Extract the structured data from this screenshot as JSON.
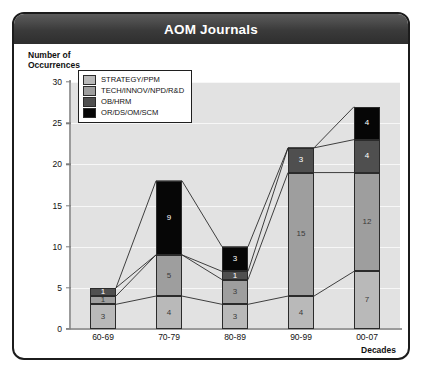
{
  "header": {
    "title": "AOM Journals"
  },
  "axis": {
    "y_title_line1": "Number of",
    "y_title_line2": "Occurrences",
    "x_title": "Decades"
  },
  "legend": {
    "items": [
      {
        "label": "STRATEGY/PPM",
        "color": "#b9b9b9"
      },
      {
        "label": "TECH/INNOV/NPD/R&D",
        "color": "#9e9e9e"
      },
      {
        "label": "OB/HRM",
        "color": "#4f4f4f"
      },
      {
        "label": "OR/DS/OM/SCM",
        "color": "#060606"
      }
    ]
  },
  "chart_data": {
    "type": "bar",
    "title": "AOM Journals",
    "xlabel": "Decades",
    "ylabel": "Number of Occurrences",
    "ylim": [
      0,
      30
    ],
    "yticks": [
      0,
      5,
      10,
      15,
      20,
      25,
      30
    ],
    "grid": true,
    "stacked": true,
    "legend_position": "upper-left-inside",
    "categories": [
      "60-69",
      "70-79",
      "80-89",
      "90-99",
      "00-07"
    ],
    "series": [
      {
        "name": "OR/DS/OM/SCM",
        "color": "#060606",
        "values": [
          3,
          4,
          3,
          4,
          7
        ]
      },
      {
        "name": "OB/HRM",
        "color": "#4f4f4f",
        "values": [
          1,
          5,
          3,
          15,
          12
        ]
      },
      {
        "name": "TECH/INNOV/NPD/R&D",
        "color": "#9e9e9e",
        "values": [
          1,
          0,
          1,
          3,
          4
        ]
      },
      {
        "name": "STRATEGY/PPM",
        "color": "#b9b9b9",
        "values": [
          0,
          9,
          3,
          0,
          4
        ]
      }
    ],
    "totals": [
      5,
      18,
      10,
      22,
      27
    ]
  }
}
